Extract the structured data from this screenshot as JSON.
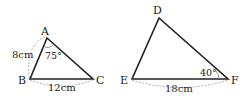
{
  "triangle_abc": {
    "vertices": {
      "A": "A",
      "B": "B",
      "C": "C"
    },
    "side_ab": "8cm",
    "side_bc": "12cm",
    "angle_a": "75°"
  },
  "triangle_def": {
    "vertices": {
      "D": "D",
      "E": "E",
      "F": "F"
    },
    "side_ef": "18cm",
    "angle_f": "40°"
  },
  "colors": {
    "line": "#222222",
    "dash": "#999999"
  }
}
